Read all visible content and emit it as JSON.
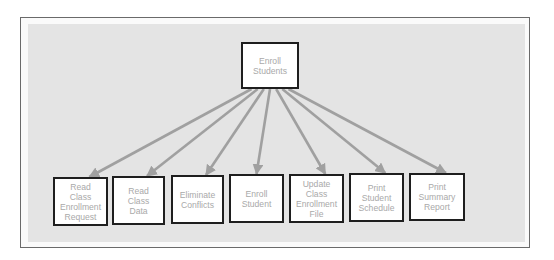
{
  "diagram": {
    "type": "structure-chart",
    "root": {
      "id": "enroll-students",
      "label": "Enroll\nStudents"
    },
    "children": [
      {
        "id": "read-class-enrollment-request",
        "label": "Read\nClass\nEnrollment\nRequest"
      },
      {
        "id": "read-class-data",
        "label": "Read\nClass\nData"
      },
      {
        "id": "eliminate-conflicts",
        "label": "Eliminate\nConflicts"
      },
      {
        "id": "enroll-student",
        "label": "Enroll\nStudent"
      },
      {
        "id": "update-class-enrollment-file",
        "label": "Update\nClass\nEnrollment\nFile"
      },
      {
        "id": "print-student-schedule",
        "label": "Print\nStudent\nSchedule"
      },
      {
        "id": "print-summary-report",
        "label": "Print\nSummary\nReport"
      }
    ],
    "edges": [
      {
        "from": "enroll-students",
        "to": "read-class-enrollment-request"
      },
      {
        "from": "enroll-students",
        "to": "read-class-data"
      },
      {
        "from": "enroll-students",
        "to": "eliminate-conflicts"
      },
      {
        "from": "enroll-students",
        "to": "enroll-student"
      },
      {
        "from": "enroll-students",
        "to": "update-class-enrollment-file"
      },
      {
        "from": "enroll-students",
        "to": "print-student-schedule"
      },
      {
        "from": "enroll-students",
        "to": "print-summary-report"
      }
    ],
    "colors": {
      "panel": "#e4e4e4",
      "arrow": "#a0a0a0",
      "box_border": "#1e1e1e",
      "box_text": "#a9a9a9"
    }
  }
}
